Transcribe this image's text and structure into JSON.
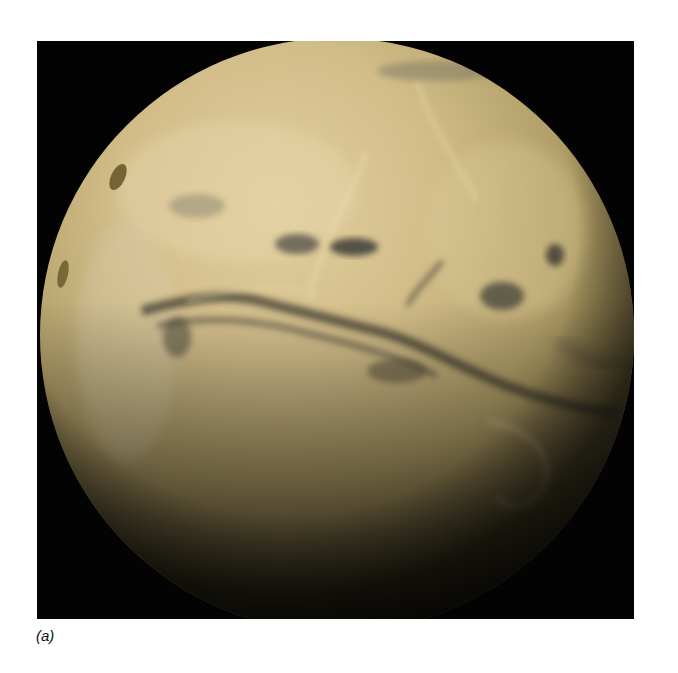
{
  "figure": {
    "caption": "(a)",
    "colors": {
      "background": "#030303",
      "planet_highlight": "#e2cf9e",
      "planet_mid": "#c9b27a",
      "planet_shadow": "#6f6238",
      "feature_dark": "#4a4634"
    }
  }
}
